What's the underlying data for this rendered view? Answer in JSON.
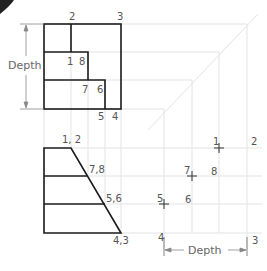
{
  "diagram": {
    "colors": {
      "object_line": "#1a1a1a",
      "construction_line": "#e3e3e3",
      "dimension_line": "#888888",
      "label": "#555555",
      "corner_mark": "#222222"
    },
    "top_view": {
      "dimension_label": "Depth",
      "point_labels": [
        {
          "text": "2",
          "x": 69,
          "y": 20
        },
        {
          "text": "3",
          "x": 117,
          "y": 20
        },
        {
          "text": "1",
          "x": 67,
          "y": 65
        },
        {
          "text": "8",
          "x": 79,
          "y": 65
        },
        {
          "text": "7",
          "x": 82,
          "y": 93
        },
        {
          "text": "6",
          "x": 97,
          "y": 93
        },
        {
          "text": "5",
          "x": 98,
          "y": 120
        },
        {
          "text": "4",
          "x": 112,
          "y": 120
        }
      ]
    },
    "front_view": {
      "point_labels": [
        {
          "text": "1, 2",
          "x": 62,
          "y": 143
        },
        {
          "text": "7,8",
          "x": 89,
          "y": 173
        },
        {
          "text": "5,6",
          "x": 106,
          "y": 202
        },
        {
          "text": "4,3",
          "x": 113,
          "y": 244
        }
      ]
    },
    "side_view": {
      "dimension_label": "Depth",
      "point_labels": [
        {
          "text": "1",
          "x": 213,
          "y": 145
        },
        {
          "text": "2",
          "x": 251,
          "y": 145
        },
        {
          "text": "7",
          "x": 184,
          "y": 174
        },
        {
          "text": "8",
          "x": 211,
          "y": 175
        },
        {
          "text": "5",
          "x": 157,
          "y": 202
        },
        {
          "text": "6",
          "x": 185,
          "y": 203
        },
        {
          "text": "4",
          "x": 158,
          "y": 241
        },
        {
          "text": "3",
          "x": 252,
          "y": 244
        }
      ]
    }
  }
}
